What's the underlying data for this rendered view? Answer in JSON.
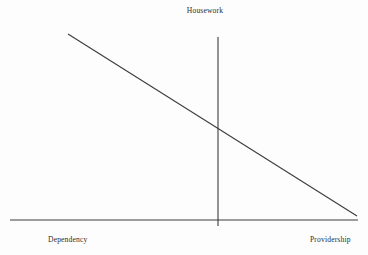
{
  "chart_data": {
    "type": "line",
    "title": "Housework",
    "xlabel": "",
    "ylabel": "",
    "axis_labels": {
      "left": "Dependency",
      "right": "Providership",
      "top": "Housework"
    },
    "legend": [],
    "grid": false,
    "annotations": [],
    "xlim": [
      0,
      1
    ],
    "ylim": [
      0,
      1
    ],
    "x": [
      0.17,
      1.0
    ],
    "values": [
      0.93,
      0.05
    ],
    "series": [
      {
        "name": "Housework",
        "x": [
          0.17,
          1.0
        ],
        "values": [
          0.93,
          0.05
        ]
      }
    ],
    "vertical_axis_x": 0.595,
    "crossing_point": {
      "x": 0.595,
      "y": 0.49
    }
  },
  "colors": {
    "line": "#3c3c3c",
    "axis": "#3c3c3c",
    "background": "#fdfdfd",
    "text": "#2f2f2f"
  },
  "geometry": {
    "x_axis": {
      "x1": 10,
      "y1": 220,
      "x2": 358,
      "y2": 220
    },
    "y_axis": {
      "x1": 218,
      "y1": 37,
      "x2": 218,
      "y2": 226
    },
    "trend": {
      "x1": 68,
      "y1": 34,
      "x2": 357,
      "y2": 216
    }
  }
}
